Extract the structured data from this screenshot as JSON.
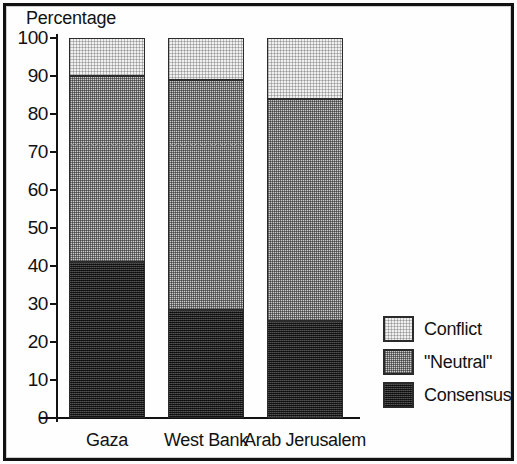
{
  "figure": {
    "axis_title": "Percentage",
    "border_color": "#111111"
  },
  "legend": {
    "items": [
      {
        "label": "Conflict",
        "color": "#f0f0f0",
        "key": "conflict"
      },
      {
        "label": "\"Neutral\"",
        "color": "#cbcbcb",
        "key": "neutral"
      },
      {
        "label": "Consensus",
        "color": "#3a3a3a",
        "key": "consensus"
      }
    ]
  },
  "chart_data": {
    "type": "bar",
    "stacked": true,
    "title": "",
    "xlabel": "",
    "ylabel": "Percentage",
    "ylim": [
      0,
      100
    ],
    "yticks": [
      0,
      10,
      20,
      30,
      40,
      50,
      60,
      70,
      80,
      90,
      100
    ],
    "ytick_labels": [
      "0",
      "10",
      "20",
      "30",
      "40",
      "50",
      "60",
      "70",
      "80",
      "90",
      "100"
    ],
    "grid": false,
    "legend_position": "right",
    "categories": [
      "Gaza",
      "West Bank",
      "Arab Jerusalem"
    ],
    "series": [
      {
        "name": "Consensus",
        "values": [
          41.0,
          28.5,
          25.5
        ],
        "color": "#3a3a3a"
      },
      {
        "name": "\"Neutral\"",
        "values": [
          49.0,
          60.5,
          58.5
        ],
        "color": "#cbcbcb"
      },
      {
        "name": "Conflict",
        "values": [
          10.0,
          11.0,
          16.0
        ],
        "color": "#f0f0f0"
      }
    ],
    "cumulative_tops": {
      "Gaza": {
        "consensus": 41.0,
        "neutral": 90.0,
        "conflict": 100.0
      },
      "West Bank": {
        "consensus": 28.5,
        "neutral": 89.0,
        "conflict": 100.0
      },
      "Arab Jerusalem": {
        "consensus": 25.5,
        "neutral": 84.0,
        "conflict": 100.0
      }
    },
    "annotations": [
      {
        "type": "reference-line",
        "value": 72,
        "style": "dotted",
        "applies_to": [
          "Gaza",
          "West Bank"
        ]
      }
    ]
  }
}
